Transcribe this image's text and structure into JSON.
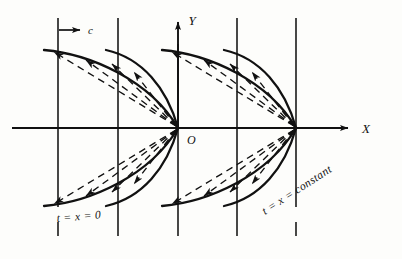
{
  "figure": {
    "background_color": "#fdfdfb",
    "ink_color": "#111111",
    "axes": {
      "x_label": "X",
      "y_label": "Y",
      "origin_label": "O",
      "x_axis_y": 128,
      "y_axis_x": 178
    },
    "annotations": {
      "speed_label": "c",
      "left_condition": "t = x = 0",
      "right_condition": "t = x = constant"
    },
    "grid": {
      "vertical_line_x": [
        58,
        118,
        178,
        237,
        296
      ],
      "vertical_top_y": 18,
      "vertical_bottom_y": 236,
      "horizontal_start_x": 12,
      "horizontal_end_x": 352
    },
    "curves": {
      "vertex_x": [
        178,
        296
      ],
      "start_x": [
        58,
        118
      ],
      "top_y": 50,
      "bottom_y": 205,
      "count_per_group": 2
    },
    "rays": {
      "description": "dashed ray arrows emanating from each parabola vertex",
      "style": "dashed",
      "arrow_direction": "away-from-vertex"
    }
  }
}
